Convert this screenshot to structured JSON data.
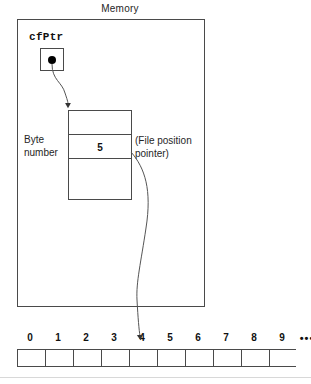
{
  "diagram": {
    "title": "Memory",
    "pointer_variable": {
      "name": "cfPtr",
      "cell_content_icon": "filled-dot"
    },
    "file_structure": {
      "byte_number_label_line1": "Byte",
      "byte_number_label_line2": "number",
      "byte_number_value": "5",
      "annotation_line1": "(File position",
      "annotation_line2": "pointer)"
    },
    "byte_array": {
      "indices": [
        "0",
        "1",
        "2",
        "3",
        "4",
        "5",
        "6",
        "7",
        "8",
        "9"
      ],
      "ellipsis": "•••",
      "cell_count": 10,
      "pointer_target_index": "5"
    },
    "colors": {
      "stroke": "#4a4a4a",
      "text": "#262626",
      "dot": "#000000",
      "background": "#ffffff"
    }
  }
}
